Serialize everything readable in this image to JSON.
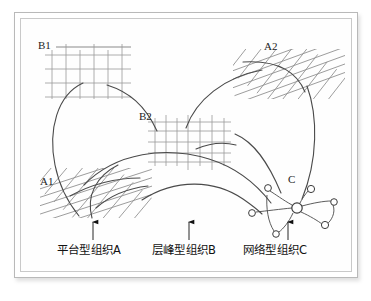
{
  "figure": {
    "background_color": "#ffffff",
    "frame_color": "#b9b9b9",
    "line_color": "#4a4a4a",
    "mesh_color": "#8c8c8c",
    "grid_color": "#9a9a9a",
    "text_color": "#1d1d1d"
  },
  "region_labels": [
    {
      "id": "B1",
      "text": "B1",
      "kind": "hierarchy-grid"
    },
    {
      "id": "A2",
      "text": "A2",
      "kind": "platform-mesh"
    },
    {
      "id": "B2",
      "text": "B2",
      "kind": "hierarchy-grid"
    },
    {
      "id": "A1",
      "text": "A1",
      "kind": "platform-mesh"
    },
    {
      "id": "C",
      "text": "C",
      "kind": "network-nodes"
    }
  ],
  "captions": [
    {
      "id": "A",
      "text": "平台型组织A",
      "arrow": "up"
    },
    {
      "id": "B",
      "text": "层峰型组织B",
      "arrow": "up"
    },
    {
      "id": "C",
      "text": "网络型组织C",
      "arrow": "up"
    }
  ],
  "network": {
    "hub": {
      "cx": 297,
      "cy": 208,
      "r": 5.2
    },
    "satellites": [
      {
        "cx": 268,
        "cy": 188,
        "r": 3.4
      },
      {
        "cx": 311,
        "cy": 189,
        "r": 3.6
      },
      {
        "cx": 334,
        "cy": 202,
        "r": 3.3
      },
      {
        "cx": 325,
        "cy": 225,
        "r": 3.6
      },
      {
        "cx": 276,
        "cy": 234,
        "r": 3.3
      },
      {
        "cx": 252,
        "cy": 213,
        "r": 3.4
      }
    ]
  },
  "grids": {
    "B1": {
      "x": 45,
      "y": 55,
      "w": 86,
      "h": 42,
      "cols": 5,
      "rows": 3,
      "rule_above": true
    },
    "B2": {
      "x": 148,
      "y": 120,
      "w": 80,
      "h": 42,
      "cols": 5,
      "rows": 3,
      "rule_above": false
    }
  },
  "meshes": {
    "A1": {
      "cx": 95,
      "cy": 192,
      "w": 110,
      "h": 48,
      "angle_deg": -18
    },
    "A2": {
      "cx": 288,
      "cy": 73,
      "w": 110,
      "h": 48,
      "angle_deg": -20
    }
  }
}
